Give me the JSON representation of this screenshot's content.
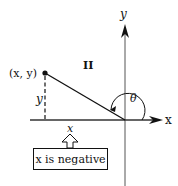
{
  "diagram": {
    "quadrant_label": "II",
    "point_label": "(x, y)",
    "y_axis_label": "y",
    "x_axis_label": "x",
    "vertical_leg_label": "y",
    "horizontal_leg_label": "x",
    "angle_label": "θ",
    "callout_text": "x is negative",
    "colors": {
      "line": "#111111",
      "axis": "#444444",
      "background": "#ffffff"
    }
  }
}
